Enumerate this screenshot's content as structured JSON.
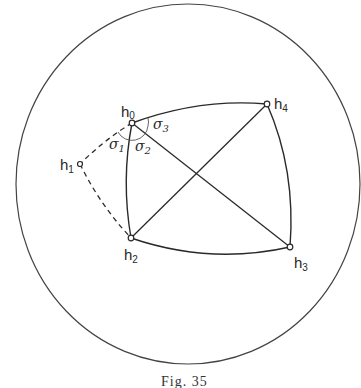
{
  "figure": {
    "caption": "Fig. 35",
    "boundary_circle": {
      "cx": 188,
      "cy": 184,
      "rx": 172,
      "ry": 180
    },
    "vertices": [
      {
        "id": "h0",
        "label": "h",
        "sub": "0",
        "x": 132,
        "y": 123
      },
      {
        "id": "h1",
        "label": "h",
        "sub": "1",
        "x": 80,
        "y": 164
      },
      {
        "id": "h2",
        "label": "h",
        "sub": "2",
        "x": 131,
        "y": 238
      },
      {
        "id": "h3",
        "label": "h",
        "sub": "3",
        "x": 290,
        "y": 247
      },
      {
        "id": "h4",
        "label": "h",
        "sub": "4",
        "x": 267,
        "y": 104
      }
    ],
    "angles": [
      {
        "id": "sigma1",
        "label": "σ",
        "sub": "1"
      },
      {
        "id": "sigma2",
        "label": "σ",
        "sub": "2"
      },
      {
        "id": "sigma3",
        "label": "σ",
        "sub": "3"
      }
    ],
    "edges_solid": [
      "h0-h4",
      "h4-h3",
      "h3-h2",
      "h2-h0",
      "h0-h3",
      "h2-h4"
    ],
    "edges_dashed": [
      "h0-h1",
      "h1-h2"
    ],
    "colors": {
      "stroke": "#2a2a2a",
      "background": "#ffffff"
    }
  }
}
